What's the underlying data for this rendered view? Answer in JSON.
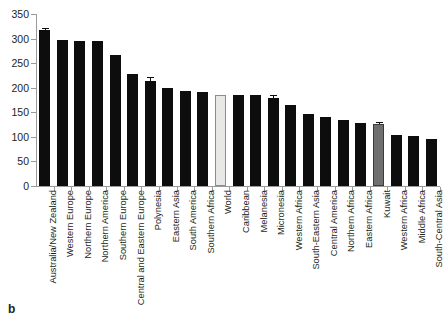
{
  "figure": {
    "panel_label": "b",
    "background_color": "#ffffff"
  },
  "axes": {
    "y_ticks": [
      "0",
      "50",
      "100",
      "150",
      "200",
      "250",
      "300",
      "350"
    ],
    "y_min": 0,
    "y_max": 350,
    "y_step": 50,
    "x_label": "",
    "y_label": ""
  },
  "colors": {
    "bar_default": "#0d0d0d",
    "bar_world": "#e8e8e6",
    "bar_world_border": "#8c8c8c",
    "bar_kuwait": "#6f6f6f",
    "bar_kuwait_border": "#3b3b3b",
    "axis": "#9a9a9a",
    "text": "#231f20"
  },
  "chart_data": {
    "type": "bar",
    "title": "",
    "subtitle": "",
    "xlabel": "",
    "ylabel": "",
    "ylim": [
      0,
      350
    ],
    "grid": false,
    "legend": "none",
    "categories": [
      "Australia/New Zealand",
      "Western Europe",
      "Northern Europe",
      "Northern America",
      "Southern Europe",
      "Central and Eastern Europe",
      "Polynesia",
      "Eastern Asia",
      "South America",
      "Southern Africa",
      "World",
      "Caribbean",
      "Melanesia",
      "Micronesia",
      "Western Africa",
      "South-Eastern Asia",
      "Central America",
      "Northern Africa",
      "Eastern Africa",
      "Kuwait",
      "Western Africa",
      "Middle Africa",
      "South-Central Asia"
    ],
    "values": [
      318,
      297,
      296,
      296,
      266,
      228,
      213,
      200,
      193,
      191,
      186,
      186,
      185,
      179,
      164,
      147,
      140,
      135,
      129,
      127,
      104,
      102,
      95
    ],
    "errors": [
      4,
      0,
      0,
      0,
      0,
      0,
      9,
      0,
      0,
      0,
      0,
      0,
      0,
      6,
      0,
      0,
      0,
      0,
      0,
      4,
      0,
      0,
      0
    ],
    "highlight": {
      "World": "light-gray",
      "Kuwait": "mid-gray"
    }
  }
}
